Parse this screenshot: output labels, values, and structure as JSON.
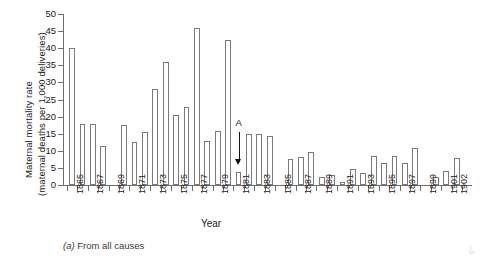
{
  "figure": {
    "caption_prefix": "(a)",
    "caption_text": "From all causes",
    "artifact_mark": "¿"
  },
  "chart_data": {
    "type": "bar",
    "title": "",
    "subtitle": "",
    "xlabel": "Year",
    "ylabel_line1": "Maternal mortality rate",
    "ylabel_line2": "(maternal deaths per 1,000 deliveries)",
    "ylim": [
      0,
      50
    ],
    "ytick_step": 5,
    "yticks": [
      0,
      5,
      10,
      15,
      20,
      25,
      30,
      35,
      40,
      45,
      50
    ],
    "ytick_labels": [
      "0",
      "5",
      "10",
      "15",
      "20",
      "25",
      "30",
      "35",
      "40",
      "45",
      "50"
    ],
    "grid": false,
    "legend": null,
    "xtick_labels_shown": [
      "1865",
      "1867",
      "1869",
      "1871",
      "1873",
      "1875",
      "1877",
      "1879",
      "1881",
      "1883",
      "1885",
      "1887",
      "1889",
      "1891",
      "1893",
      "1895",
      "1897",
      "1899",
      "1901",
      "1902"
    ],
    "categories": [
      "1865",
      "1866",
      "1867",
      "1868",
      "1869",
      "1870",
      "1871",
      "1872",
      "1873",
      "1874",
      "1875",
      "1876",
      "1877",
      "1878",
      "1879",
      "1880",
      "1881",
      "1882",
      "1883",
      "1884",
      "1885",
      "1886",
      "1887",
      "1888",
      "1889",
      "1890",
      "1891",
      "1892",
      "1893",
      "1894",
      "1895",
      "1896",
      "1897",
      "1898",
      "1899",
      "1900",
      "1901",
      "1902"
    ],
    "values": [
      40.2,
      17.7,
      17.7,
      11.5,
      0,
      17.6,
      12.7,
      15.6,
      28.0,
      36.0,
      20.5,
      22.8,
      46.0,
      13.0,
      15.7,
      42.5,
      3.8,
      14.8,
      14.8,
      14.2,
      0,
      7.5,
      8.2,
      9.6,
      2.4,
      2.9,
      0.8,
      4.6,
      3.5,
      8.4,
      6.5,
      8.4,
      6.3,
      10.8,
      0,
      2.3,
      4.2,
      7.8
    ],
    "annotation": {
      "label": "A",
      "points_to_year": "1881",
      "points_to_value": 3.8
    }
  }
}
